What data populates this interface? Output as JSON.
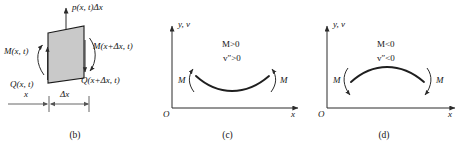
{
  "figure": {
    "panels": [
      {
        "id": "b",
        "caption": "(b)",
        "labels": {
          "load": "p(x, t)Δx",
          "moment_left": "M(x, t)",
          "moment_right": "M(x+Δx, t)",
          "shear_left": "Q(x, t)",
          "shear_right": "Q(x+Δx, t)",
          "dim_x": "x",
          "dim_dx": "Δx"
        },
        "element_fill": "#c9c9c9",
        "element_stroke": "#1a1a1a"
      },
      {
        "id": "c",
        "caption": "(c)",
        "labels": {
          "y_axis": "y, v",
          "x_axis": "x",
          "origin": "O",
          "condition_moment": "M>0",
          "condition_curvature": "v″>0",
          "moment_left": "M",
          "moment_right": "M"
        },
        "curvature": "concave-up",
        "arrow_direction": "up"
      },
      {
        "id": "d",
        "caption": "(d)",
        "labels": {
          "y_axis": "y, v",
          "x_axis": "x",
          "origin": "O",
          "condition_moment": "M<0",
          "condition_curvature": "v″<0",
          "moment_left": "M",
          "moment_right": "M"
        },
        "curvature": "concave-down",
        "arrow_direction": "down"
      }
    ],
    "colors": {
      "ink": "#141414",
      "line": "#3a3a3a",
      "element_fill": "#c9c9c9"
    }
  }
}
